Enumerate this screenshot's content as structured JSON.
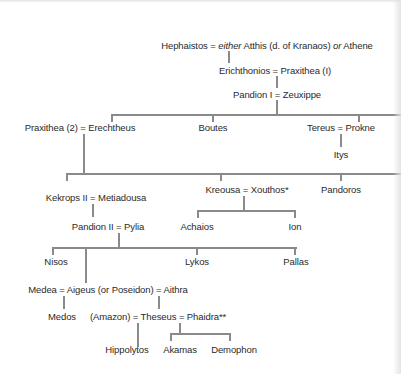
{
  "diagram": {
    "type": "genealogy-tree",
    "nodes": {
      "hephaistos": {
        "pre": "Hephaistos = ",
        "em1": "either",
        "mid": " Atthis (d. of Kranaos) ",
        "em2": "or",
        "post": " Athene"
      },
      "erichthonios": "Erichthonios = Praxithea (I)",
      "pandion1": "Pandion I = Zeuxippe",
      "erechtheus": "Praxithea (2) = Erechtheus",
      "boutes": "Boutes",
      "tereus": "Tereus = Prokne",
      "itys": "Itys",
      "kekrops2": "Kekrops II = Metiadousa",
      "kreousa": "Kreousa = Xouthos*",
      "pandoros": "Pandoros",
      "achaios": "Achaios",
      "ion": "Ion",
      "pandion2": "Pandion II = Pylia",
      "nisos": "Nisos",
      "lykos": "Lykos",
      "pallas": "Pallas",
      "aigeus": "Medea = Aigeus (or Poseidon) = Aithra",
      "medos": "Medos",
      "theseus": "(Amazon) = Theseus = Phaidra**",
      "hippolytos": "Hippolytos",
      "akamas": "Akamas",
      "demophon": "Demophon"
    },
    "edges": [
      [
        "hephaistos",
        "erichthonios"
      ],
      [
        "erichthonios",
        "pandion1"
      ],
      [
        "pandion1",
        "erechtheus"
      ],
      [
        "pandion1",
        "boutes"
      ],
      [
        "pandion1",
        "tereus"
      ],
      [
        "tereus",
        "itys"
      ],
      [
        "erechtheus",
        "kekrops2"
      ],
      [
        "erechtheus",
        "kreousa"
      ],
      [
        "erechtheus",
        "pandoros"
      ],
      [
        "kreousa",
        "achaios"
      ],
      [
        "kreousa",
        "ion"
      ],
      [
        "kekrops2",
        "pandion2"
      ],
      [
        "pandion2",
        "nisos"
      ],
      [
        "pandion2",
        "aigeus"
      ],
      [
        "pandion2",
        "lykos"
      ],
      [
        "pandion2",
        "pallas"
      ],
      [
        "aigeus",
        "medos"
      ],
      [
        "aigeus",
        "theseus"
      ],
      [
        "theseus",
        "hippolytos"
      ],
      [
        "theseus",
        "akamas"
      ],
      [
        "theseus",
        "demophon"
      ]
    ]
  }
}
